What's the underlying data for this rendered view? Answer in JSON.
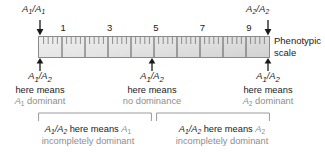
{
  "figure": {
    "scale_caption_line1": "Phenotypic",
    "scale_caption_line2": "scale",
    "tick_labels": [
      "1",
      "3",
      "5",
      "7",
      "9"
    ],
    "axis": {
      "min": 0,
      "max": 10,
      "major_interval": 1,
      "minor_ticks_per_major": 4,
      "numbered_ticks": [
        1,
        3,
        5,
        7,
        9
      ]
    },
    "colors": {
      "bar_fill_light": "#efefef",
      "bar_fill_dark": "#d2d2d2",
      "bar_border": "#8a8a8a",
      "text": "#1a1a1a",
      "gray_text": "#8e8e8e",
      "tick": "#555555"
    }
  },
  "top_markers": {
    "left": {
      "allele_a": "A",
      "sub_a": "1",
      "allele_b": "A",
      "sub_b": "1",
      "separator": "/",
      "scale_position": 0
    },
    "right": {
      "allele_a": "A",
      "sub_a": "2",
      "allele_b": "A",
      "sub_b": "2",
      "separator": "/",
      "scale_position": 10
    }
  },
  "explanations": [
    {
      "genotype_a": "A",
      "genotype_a_sub": "1",
      "genotype_b": "A",
      "genotype_b_sub": "2",
      "separator": "/",
      "line2": "here means",
      "line3_allele": "A",
      "line3_allele_sub": "1",
      "line3_rest": " dominant",
      "scale_position": 0
    },
    {
      "genotype_a": "A",
      "genotype_a_sub": "1",
      "genotype_b": "A",
      "genotype_b_sub": "2",
      "separator": "/",
      "line2": "here means",
      "line3_allele": "",
      "line3_allele_sub": "",
      "line3_rest": "no dominance",
      "scale_position": 5
    },
    {
      "genotype_a": "A",
      "genotype_a_sub": "1",
      "genotype_b": "A",
      "genotype_b_sub": "2",
      "separator": "/",
      "line2": "here means",
      "line3_allele": "A",
      "line3_allele_sub": "2",
      "line3_rest": " dominant",
      "scale_position": 10
    }
  ],
  "brackets": [
    {
      "genotype_a": "A",
      "genotype_a_sub": "1",
      "genotype_b": "A",
      "genotype_b_sub": "2",
      "separator": "/",
      "phrase": " here means ",
      "allele": "A",
      "allele_sub": "1",
      "line2": "incompletely dominant",
      "range_start": 0,
      "range_end": 5
    },
    {
      "genotype_a": "A",
      "genotype_a_sub": "1",
      "genotype_b": "A",
      "genotype_b_sub": "2",
      "separator": "/",
      "phrase": " here means ",
      "allele": "A",
      "allele_sub": "2",
      "line2": "incompletely dominant",
      "range_start": 5,
      "range_end": 10
    }
  ]
}
